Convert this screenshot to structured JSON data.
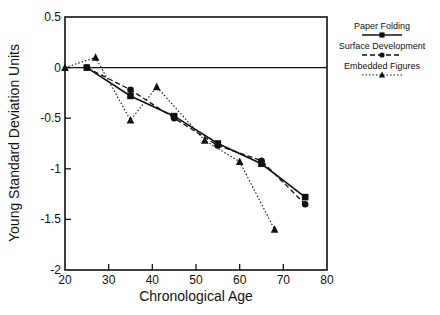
{
  "chart_data": {
    "type": "line",
    "title": "",
    "xlabel": "Chronological Age",
    "ylabel": "Young Standard Deviation Units",
    "xlim": [
      20,
      80
    ],
    "ylim": [
      -2,
      0.5
    ],
    "xticks": [
      20,
      30,
      40,
      50,
      60,
      70,
      80
    ],
    "yticks": [
      0.5,
      0,
      -0.5,
      -1,
      -1.5,
      -2
    ],
    "ytick_labels": [
      "0.5",
      "0",
      "-0.5",
      "-1",
      "-1.5",
      "-2"
    ],
    "grid": false,
    "reference_line": {
      "y": 0
    },
    "legend_position": "right, outside plot",
    "series": [
      {
        "name": "Paper Folding",
        "marker": "square",
        "line": "solid",
        "x": [
          25,
          35,
          45,
          55,
          65,
          75
        ],
        "y": [
          0,
          -0.28,
          -0.48,
          -0.75,
          -0.95,
          -1.28
        ]
      },
      {
        "name": "Surface Development",
        "marker": "circle",
        "line": "dashed",
        "x": [
          25,
          35,
          45,
          55,
          65,
          75
        ],
        "y": [
          0,
          -0.22,
          -0.5,
          -0.77,
          -0.92,
          -1.35
        ]
      },
      {
        "name": "Embedded Figures",
        "marker": "triangle",
        "line": "dotted",
        "x": [
          20,
          27,
          35,
          41,
          52,
          60,
          68
        ],
        "y": [
          0,
          0.1,
          -0.52,
          -0.19,
          -0.72,
          -0.93,
          -1.6
        ]
      }
    ]
  },
  "legend": {
    "items": [
      {
        "label": "Paper Folding"
      },
      {
        "label": "Surface Development"
      },
      {
        "label": "Embedded Figures"
      }
    ]
  }
}
